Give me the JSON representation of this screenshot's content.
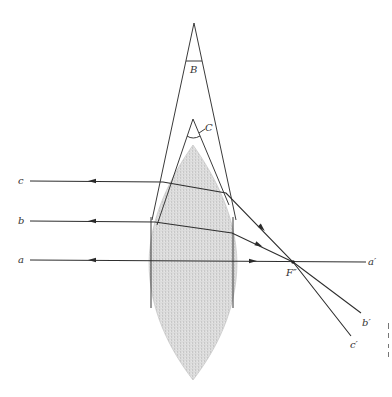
{
  "figure": {
    "labels": {
      "prism_outer_angle": "B",
      "prism_inner_angle": "C",
      "focal_point": "F″",
      "ray_in_a": "a",
      "ray_in_b": "b",
      "ray_in_c": "c",
      "ray_out_a": "a′",
      "ray_out_b": "b′",
      "ray_out_c": "c′"
    },
    "colors": {
      "background": "#ffffff",
      "lens_fill": "#d9d9d9",
      "line": "#333333"
    }
  }
}
